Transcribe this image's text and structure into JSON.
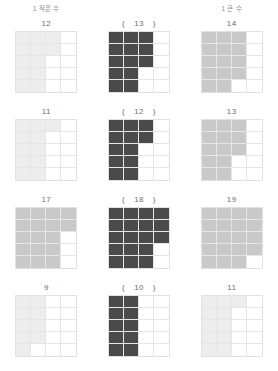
{
  "header": {
    "left_label": "1 작은 수",
    "center_label": "",
    "right_label": "1 큰 수"
  },
  "grid": {
    "columns": 4,
    "rows": 5,
    "total_cells": 20,
    "fill_order": "column-major-top-to-bottom"
  },
  "colors": {
    "light_fill": "#ededed",
    "medium_fill": "#c9c9c9",
    "dark_fill": "#4a4a4a",
    "empty_fill": "#ffffff",
    "grid_line": "#e6e6e6",
    "grid_border": "#e2e2e2",
    "label_text": "#6f6f6f",
    "header_text": "#8d8d8d"
  },
  "paren": {
    "open": "(",
    "close": ")"
  },
  "rows": [
    {
      "left": {
        "label": "12",
        "count": 12,
        "shade": "light_fill"
      },
      "center": {
        "label": "13",
        "count": 13,
        "shade": "dark_fill",
        "parenthesized": true
      },
      "right": {
        "label": "14",
        "count": 14,
        "shade": "medium_fill"
      }
    },
    {
      "left": {
        "label": "11",
        "count": 11,
        "shade": "light_fill"
      },
      "center": {
        "label": "12",
        "count": 12,
        "shade": "dark_fill",
        "parenthesized": true
      },
      "right": {
        "label": "13",
        "count": 13,
        "shade": "medium_fill"
      }
    },
    {
      "left": {
        "label": "17",
        "count": 17,
        "shade": "medium_fill"
      },
      "center": {
        "label": "18",
        "count": 18,
        "shade": "dark_fill",
        "parenthesized": true
      },
      "right": {
        "label": "19",
        "count": 19,
        "shade": "medium_fill"
      }
    },
    {
      "left": {
        "label": "9",
        "count": 9,
        "shade": "light_fill"
      },
      "center": {
        "label": "10",
        "count": 10,
        "shade": "dark_fill",
        "parenthesized": true
      },
      "right": {
        "label": "11",
        "count": 11,
        "shade": "light_fill"
      }
    }
  ]
}
